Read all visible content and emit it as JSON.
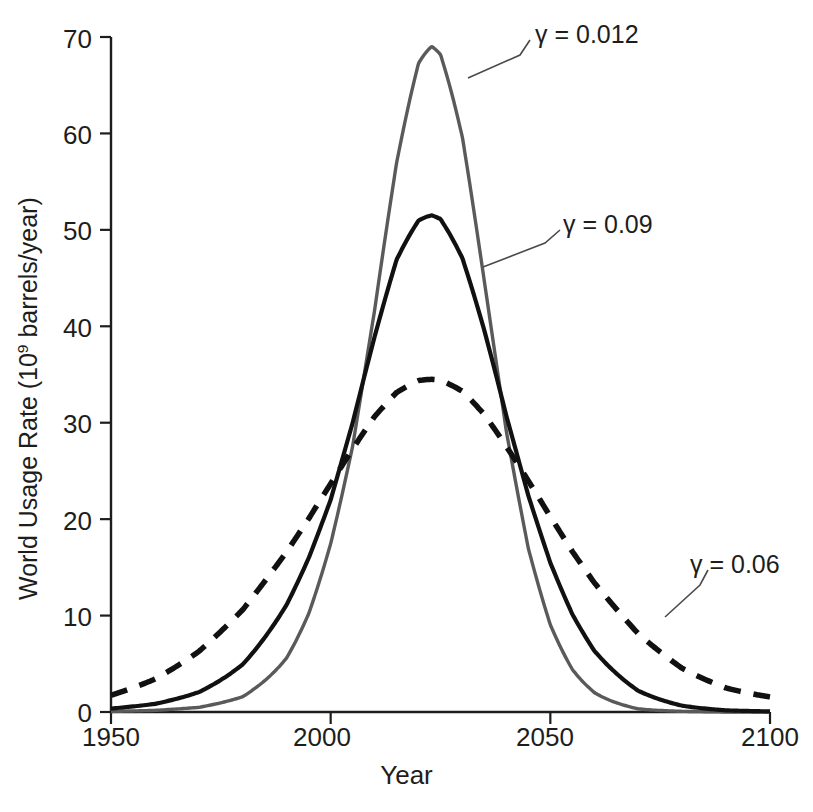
{
  "chart_data": {
    "type": "line",
    "title": "",
    "xlabel": "Year",
    "ylabel": "World Usage Rate (10⁹ barrels/year)",
    "ylabel_prefix": "World Usage Rate (10",
    "ylabel_exponent": "9",
    "ylabel_suffix": " barrels/year)",
    "xlim": [
      1950,
      2100
    ],
    "ylim": [
      0,
      70
    ],
    "xticks": [
      1950,
      2000,
      2050,
      2100
    ],
    "xtick_labels": [
      "1950",
      "2000",
      "2050",
      "2100"
    ],
    "yticks": [
      0,
      10,
      20,
      30,
      40,
      50,
      60,
      70
    ],
    "ytick_labels": [
      "0",
      "10",
      "20",
      "30",
      "40",
      "50",
      "60",
      "70"
    ],
    "grid": false,
    "legend": "annotations on curves",
    "series": [
      {
        "name": "γ = 0.012",
        "label": "γ = 0.012",
        "style": "solid",
        "color": "#5a5a5a",
        "peak_year": 2023,
        "peak_value": 69,
        "width_sigma": 14.5,
        "x": [
          1950,
          1960,
          1970,
          1980,
          1990,
          1995,
          2000,
          2005,
          2010,
          2015,
          2020,
          2023,
          2025,
          2030,
          2035,
          2040,
          2045,
          2050,
          2055,
          2060,
          2070,
          2080,
          2090,
          2100
        ],
        "values": [
          0.1,
          0.3,
          0.8,
          2.2,
          6.0,
          9.8,
          15.7,
          24.0,
          38.0,
          55.0,
          67.0,
          69.0,
          68.0,
          58.0,
          41.0,
          24.5,
          13.0,
          6.5,
          3.1,
          1.5,
          0.3,
          0.1,
          0.0,
          0.0
        ]
      },
      {
        "name": "γ = 0.09",
        "label": "γ = 0.09",
        "style": "solid",
        "color": "#111111",
        "peak_year": 2023,
        "peak_value": 51.5,
        "width_sigma": 19.5,
        "x": [
          1950,
          1960,
          1970,
          1980,
          1990,
          1995,
          2000,
          2005,
          2010,
          2015,
          2020,
          2023,
          2025,
          2030,
          2035,
          2040,
          2045,
          2050,
          2055,
          2060,
          2070,
          2080,
          2090,
          2100
        ],
        "values": [
          0.6,
          1.3,
          2.7,
          5.3,
          10.2,
          14.0,
          19.0,
          27.0,
          37.0,
          46.5,
          51.0,
          51.5,
          51.0,
          46.0,
          37.0,
          27.0,
          18.5,
          12.0,
          7.5,
          4.6,
          1.7,
          0.6,
          0.2,
          0.1
        ]
      },
      {
        "name": "γ = 0.06",
        "label": "γ = 0.06",
        "style": "dashed",
        "color": "#111111",
        "peak_year": 2023,
        "peak_value": 34.5,
        "width_sigma": 30.0,
        "x": [
          1950,
          1960,
          1970,
          1980,
          1990,
          1995,
          2000,
          2005,
          2010,
          2015,
          2020,
          2023,
          2025,
          2030,
          2035,
          2040,
          2045,
          2050,
          2055,
          2060,
          2070,
          2080,
          2090,
          2100
        ],
        "values": [
          1.7,
          3.1,
          5.5,
          9.2,
          14.8,
          18.2,
          22.0,
          26.0,
          30.0,
          33.0,
          34.4,
          34.5,
          34.4,
          33.0,
          30.0,
          26.0,
          22.0,
          18.0,
          14.3,
          11.2,
          6.5,
          3.6,
          2.2,
          1.8
        ]
      }
    ],
    "annotations": [
      {
        "text": "γ = 0.012",
        "target_series": "γ = 0.012"
      },
      {
        "text": "γ = 0.09",
        "target_series": "γ = 0.09"
      },
      {
        "text": "γ = 0.06",
        "target_series": "γ = 0.06"
      }
    ]
  },
  "axes": {
    "x_title": "Year",
    "y_title_prefix": "World Usage Rate (10",
    "y_title_exponent": "9",
    "y_title_suffix": " barrels/year)"
  }
}
